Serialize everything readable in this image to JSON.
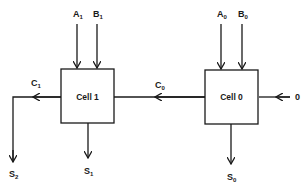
{
  "diagram": {
    "type": "ripple-carry adder cells",
    "cells": [
      {
        "id": "cell1",
        "label": "Cell 1",
        "inputs": [
          {
            "base": "A",
            "sub": "1"
          },
          {
            "base": "B",
            "sub": "1"
          }
        ],
        "sum": {
          "base": "S",
          "sub": "1"
        },
        "carry_out": {
          "base": "C",
          "sub": "1"
        }
      },
      {
        "id": "cell0",
        "label": "Cell 0",
        "inputs": [
          {
            "base": "A",
            "sub": "0"
          },
          {
            "base": "B",
            "sub": "0"
          }
        ],
        "sum": {
          "base": "S",
          "sub": "0"
        },
        "carry_out": {
          "base": "C",
          "sub": "0"
        }
      }
    ],
    "carry_in_label": "0",
    "final_output": {
      "base": "S",
      "sub": "2"
    },
    "colors": {
      "stroke": "#1a1a1a",
      "background": "#ffffff"
    }
  }
}
